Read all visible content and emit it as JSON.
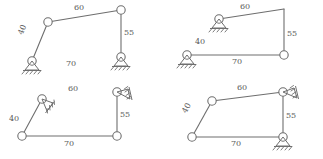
{
  "figure": {
    "type": "four-bar-linkage-inversions",
    "panel_count": 4,
    "colors": {
      "line": "#6e6e6e",
      "text": "#5a5a5a",
      "background": "#ffffff"
    },
    "panels": [
      {
        "id": "panel-1",
        "name": "inversion-a",
        "labels": {
          "coupler": "60",
          "left_crank": "40",
          "right_crank": "55",
          "ground": "70"
        },
        "supports": [
          "pin-ground-left",
          "pin-ground-right"
        ]
      },
      {
        "id": "panel-2",
        "name": "inversion-b",
        "labels": {
          "coupler": "60",
          "left_crank": "40",
          "right_crank": "55",
          "ground": "70"
        },
        "supports": [
          "pin-ground-upper-left",
          "pin-ground-lower-left"
        ]
      },
      {
        "id": "panel-3",
        "name": "inversion-c",
        "labels": {
          "coupler": "60",
          "left_crank": "40",
          "right_crank": "55",
          "ground": "70"
        },
        "supports": [
          "pin-ground-upper-left",
          "pin-ground-upper-right"
        ]
      },
      {
        "id": "panel-4",
        "name": "inversion-d",
        "labels": {
          "coupler": "60",
          "left_crank": "40",
          "right_crank": "55",
          "ground": "70"
        },
        "supports": [
          "pin-ground-upper-right",
          "pin-ground-lower-right"
        ]
      }
    ]
  }
}
